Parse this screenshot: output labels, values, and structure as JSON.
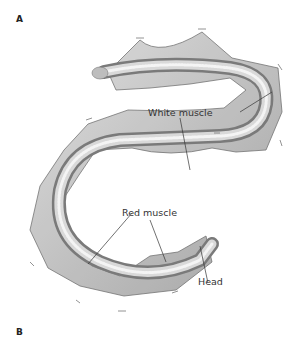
{
  "figure": {
    "panels": [
      {
        "label": "A"
      },
      {
        "label": "B"
      }
    ],
    "annotations": {
      "white_muscle": "White muscle",
      "red_muscle": "Red muscle",
      "head": "Head"
    },
    "colors": {
      "body_light": "#e2e2e2",
      "body_mid": "#b8b8b8",
      "body_dark": "#6f6f6f",
      "leader_line": "#333333"
    }
  }
}
